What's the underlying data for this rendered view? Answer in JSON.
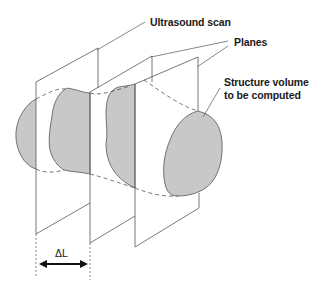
{
  "diagram": {
    "labels": {
      "ultrasound_scan": "Ultrasound scan",
      "planes": "Planes",
      "structure_line1": "Structure volume",
      "structure_line2": "to be computed",
      "delta_l": "ΔL"
    },
    "colors": {
      "line": "#4a4a4a",
      "fill": "#c8c8c8",
      "text": "#1a1a1a"
    }
  }
}
